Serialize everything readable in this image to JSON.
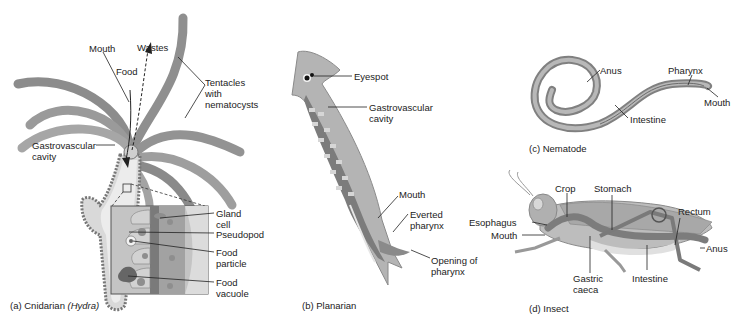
{
  "figure": {
    "panels": [
      {
        "id": "a",
        "caption_prefix": "(a) Cnidarian",
        "caption_italic": "(Hydra)",
        "labels": {
          "mouth": "Mouth",
          "wastes": "Wastes",
          "food": "Food",
          "tentacles_1": "Tentacles",
          "tentacles_2": "with",
          "tentacles_3": "nematocysts",
          "gv_1": "Gastrovascular",
          "gv_2": "cavity",
          "gland_1": "Gland",
          "gland_2": "cell",
          "pseudopod": "Pseudopod",
          "particle_1": "Food",
          "particle_2": "particle",
          "vacuole_1": "Food",
          "vacuole_2": "vacuole"
        }
      },
      {
        "id": "b",
        "caption": "(b) Planarian",
        "labels": {
          "eyespot": "Eyespot",
          "gv_1": "Gastrovascular",
          "gv_2": "cavity",
          "mouth": "Mouth",
          "everted_1": "Everted",
          "everted_2": "pharynx",
          "opening_1": "Opening of",
          "opening_2": "pharynx"
        }
      },
      {
        "id": "c",
        "caption": "(c) Nematode",
        "labels": {
          "anus": "Anus",
          "pharynx": "Pharynx",
          "mouth": "Mouth",
          "intestine": "Intestine"
        }
      },
      {
        "id": "d",
        "caption": "(d) Insect",
        "labels": {
          "crop": "Crop",
          "stomach": "Stomach",
          "rectum": "Rectum",
          "esophagus": "Esophagus",
          "mouth": "Mouth",
          "anus": "Anus",
          "gastric_1": "Gastric",
          "gastric_2": "caeca",
          "intestine": "Intestine"
        }
      }
    ]
  },
  "colors": {
    "body_fill": "#9a9a9a",
    "body_light": "#c8c8c8",
    "body_dark": "#6e6e6e",
    "label_text": "#222222"
  }
}
